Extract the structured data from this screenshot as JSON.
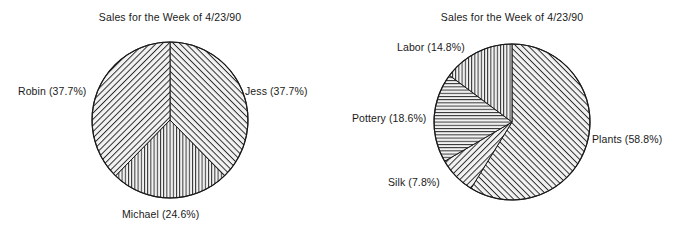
{
  "chart_data": [
    {
      "type": "pie",
      "id": "sales-by-person",
      "title": "Sales for the Week of 4/23/90",
      "start_angle_deg": 0,
      "direction": "clockwise",
      "center": {
        "x": 170,
        "y": 120
      },
      "radius": 78,
      "labels": [
        "Jess",
        "Michael",
        "Robin"
      ],
      "values": [
        37.7,
        24.6,
        37.7
      ],
      "value_unit": "%",
      "slices": [
        {
          "label": "Jess",
          "value": 37.7,
          "text": "Jess (37.7%)",
          "pattern": "diagonal-backslash",
          "label_x": 245,
          "label_y": 85
        },
        {
          "label": "Michael",
          "value": 24.6,
          "text": "Michael (24.6%)",
          "pattern": "vertical",
          "label_x": 122,
          "label_y": 208
        },
        {
          "label": "Robin",
          "value": 37.7,
          "text": "Robin (37.7%)",
          "pattern": "diagonal-slash",
          "label_x": 18,
          "label_y": 85
        }
      ],
      "legend": "none",
      "grid": false
    },
    {
      "type": "pie",
      "id": "sales-by-category",
      "title": "Sales for the Week of 4/23/90",
      "start_angle_deg": 0,
      "direction": "clockwise",
      "center": {
        "x": 172,
        "y": 122
      },
      "radius": 78,
      "labels": [
        "Plants",
        "Silk",
        "Pottery",
        "Labor"
      ],
      "values": [
        58.8,
        7.8,
        18.6,
        14.8
      ],
      "value_unit": "%",
      "slices": [
        {
          "label": "Plants",
          "value": 58.8,
          "text": "Plants (58.8%)",
          "pattern": "diagonal-backslash",
          "label_x": 252,
          "label_y": 133
        },
        {
          "label": "Silk",
          "value": 7.8,
          "text": "Silk (7.8%)",
          "pattern": "diagonal-slash",
          "label_x": 48,
          "label_y": 176
        },
        {
          "label": "Pottery",
          "value": 18.6,
          "text": "Pottery (18.6%)",
          "pattern": "horizontal",
          "label_x": 12,
          "label_y": 112
        },
        {
          "label": "Labor",
          "value": 14.8,
          "text": "Labor (14.8%)",
          "pattern": "vertical",
          "label_x": 57,
          "label_y": 41
        }
      ],
      "legend": "none",
      "grid": false
    }
  ],
  "style": {
    "background_color": "#ffffff",
    "line_color": "#1a1a1a",
    "fill_color": "#f2f2f2",
    "text_color": "#1a1a1a"
  }
}
